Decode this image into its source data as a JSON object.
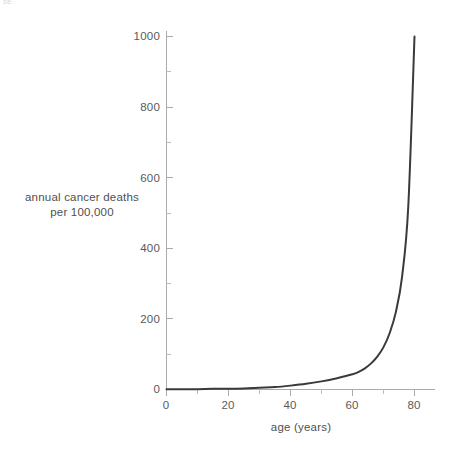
{
  "artifact": {
    "top_edge_remnant": "se"
  },
  "chart_data": {
    "type": "line",
    "title": "",
    "subtitle": "",
    "xlabel": "age (years)",
    "ylabel_lines": [
      "annual cancer deaths",
      "per 100,000"
    ],
    "ylabel": "annual cancer deaths per 100,000",
    "xlim": [
      0,
      87
    ],
    "ylim": [
      0,
      1014
    ],
    "grid": false,
    "legend": null,
    "legend_position": "none",
    "xticks": [
      0,
      20,
      40,
      60,
      80
    ],
    "xtick_labels": [
      "0",
      "20",
      "40",
      "60",
      "80"
    ],
    "xticks_minor": [
      10,
      30,
      50,
      70
    ],
    "yticks": [
      0,
      200,
      400,
      600,
      800,
      1000
    ],
    "ytick_labels": [
      "0",
      "200",
      "400",
      "600",
      "800",
      "1000"
    ],
    "yticks_minor": [
      100,
      300,
      500,
      700,
      900
    ],
    "series": [
      {
        "name": "annual cancer deaths per 100,000",
        "color": "#3a3a3a",
        "line_width": 2,
        "x": [
          0,
          5,
          10,
          15,
          20,
          25,
          30,
          35,
          40,
          45,
          50,
          55,
          60,
          62,
          64,
          66,
          68,
          70,
          72,
          74,
          76,
          78,
          80
        ],
        "values": [
          1,
          1,
          1,
          2,
          2,
          3,
          5,
          7,
          11,
          16,
          23,
          32,
          43,
          50,
          60,
          74,
          93,
          120,
          160,
          220,
          320,
          520,
          1000
        ]
      }
    ],
    "colors": {
      "curve": "#3a3a3a",
      "axis": "#aaaaaa",
      "tick": "#b0b0b0",
      "tick_label": "#5a5a5a",
      "axis_title": "#4f4f4f",
      "background": "#ffffff"
    }
  }
}
